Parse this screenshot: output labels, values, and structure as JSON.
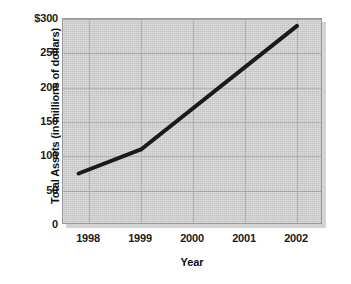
{
  "chart_data": {
    "type": "line",
    "title": "",
    "xlabel": "Year",
    "ylabel": "Total Assets (in millions of dollars)",
    "xlim": [
      1997.5,
      2002.5
    ],
    "ylim": [
      0,
      300
    ],
    "xticks": [
      "1998",
      "1999",
      "2000",
      "2001",
      "2002"
    ],
    "xtick_values": [
      1998,
      1999,
      2000,
      2001,
      2002
    ],
    "yticks": [
      "0",
      "50",
      "100",
      "150",
      "200",
      "250",
      "$300"
    ],
    "ytick_values": [
      0,
      50,
      100,
      150,
      200,
      250,
      300
    ],
    "grid": true,
    "legend": null,
    "series": [
      {
        "name": "Total Assets",
        "x": [
          1997.8,
          1999.0,
          2002.0
        ],
        "values": [
          75,
          110,
          290
        ],
        "points": [
          {
            "x": 1997.8,
            "y": 75
          },
          {
            "x": 1999.0,
            "y": 110
          },
          {
            "x": 2002.0,
            "y": 290
          }
        ],
        "color": "#1a1a1a"
      }
    ],
    "plot_background": "#cfcfcf",
    "grid_color": "#a6a6a6"
  }
}
